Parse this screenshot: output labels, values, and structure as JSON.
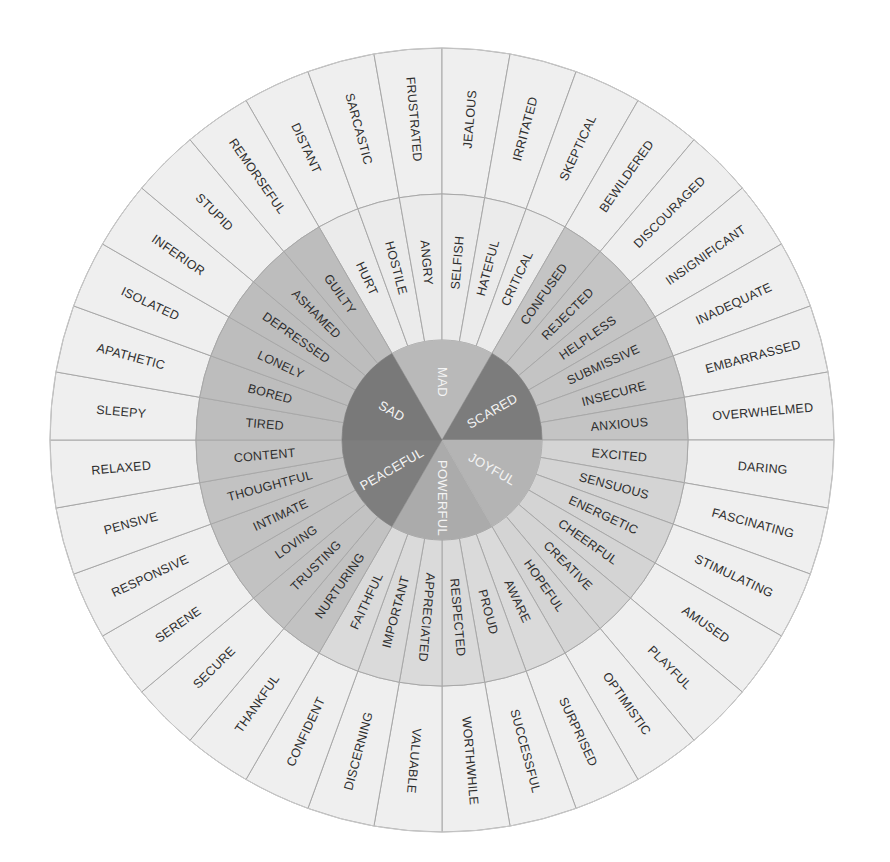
{
  "colors": {
    "outer_ring": "#efefef",
    "divider": "#a8a8a8",
    "text": "#2e2e2e",
    "core_text": "#f4f4f4"
  },
  "core": [
    {
      "label": "MAD",
      "color": "#b9b9b9",
      "middle_color": "#ebebeb",
      "middle": [
        "HURT",
        "HOSTILE",
        "ANGRY",
        "SELFISH",
        "HATEFUL",
        "CRITICAL"
      ],
      "outer": [
        "DISTANT",
        "SARCASTIC",
        "FRUSTRATED",
        "JEALOUS",
        "IRRITATED",
        "SKEPTICAL"
      ]
    },
    {
      "label": "SCARED",
      "color": "#7c7c7c",
      "middle_color": "#c4c4c4",
      "middle": [
        "CONFUSED",
        "REJECTED",
        "HELPLESS",
        "SUBMISSIVE",
        "INSECURE",
        "ANXIOUS"
      ],
      "outer": [
        "BEWILDERED",
        "DISCOURAGED",
        "INSIGNIFICANT",
        "INADEQUATE",
        "EMBARRASSED",
        "OVERWHELMED"
      ]
    },
    {
      "label": "JOYFUL",
      "color": "#b4b4b4",
      "middle_color": "#d4d4d4",
      "middle": [
        "EXCITED",
        "SENSUOUS",
        "ENERGETIC",
        "CHEERFUL",
        "CREATIVE",
        "HOPEFUL"
      ],
      "outer": [
        "DARING",
        "FASCINATING",
        "STIMULATING",
        "AMUSED",
        "PLAYFUL",
        "OPTIMISTIC"
      ]
    },
    {
      "label": "POWERFUL",
      "color": "#ababab",
      "middle_color": "#dadada",
      "middle": [
        "AWARE",
        "PROUD",
        "RESPECTED",
        "APPRECIATED",
        "IMPORTANT",
        "FAITHFUL"
      ],
      "outer": [
        "SURPRISED",
        "SUCCESSFUL",
        "WORTHWHILE",
        "VALUABLE",
        "DISCERNING",
        "CONFIDENT"
      ]
    },
    {
      "label": "PEACEFUL",
      "color": "#7e7e7e",
      "middle_color": "#c2c2c2",
      "middle": [
        "NURTURING",
        "TRUSTING",
        "LOVING",
        "INTIMATE",
        "THOUGHTFUL",
        "CONTENT"
      ],
      "outer": [
        "THANKFUL",
        "SECURE",
        "SERENE",
        "RESPONSIVE",
        "PENSIVE",
        "RELAXED"
      ]
    },
    {
      "label": "SAD",
      "color": "#797979",
      "middle_color": "#bdbdbd",
      "middle": [
        "TIRED",
        "BORED",
        "LONELY",
        "DEPRESSED",
        "ASHAMED",
        "GUILTY"
      ],
      "outer": [
        "SLEEPY",
        "APATHETIC",
        "ISOLATED",
        "INFERIOR",
        "STUPID",
        "REMORSEFUL"
      ]
    }
  ]
}
